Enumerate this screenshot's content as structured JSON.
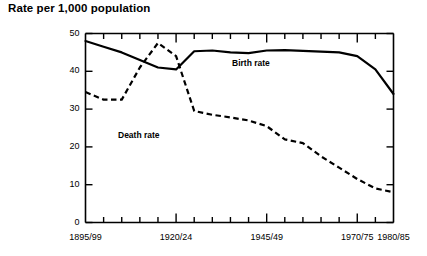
{
  "chart_data": {
    "type": "line",
    "title": "Rate per 1,000 population",
    "xlabel": "",
    "ylabel": "",
    "ylim": [
      0,
      50
    ],
    "yticks": [
      0,
      10,
      20,
      30,
      40,
      50
    ],
    "ytick_labels": [
      "0",
      "10",
      "20",
      "30",
      "40",
      "50"
    ],
    "grid": false,
    "legend": "inline-annotations",
    "x_categories": [
      "1895/99",
      "1900/04",
      "1905/09",
      "1910/14",
      "1915/19",
      "1920/24",
      "1925/29",
      "1930/34",
      "1935/39",
      "1940/44",
      "1945/49",
      "1950/54",
      "1955/59",
      "1960/64",
      "1965/69",
      "1970/75",
      "1975/79",
      "1980/85"
    ],
    "xtick_labels": [
      "1895/99",
      "1920/24",
      "1945/49",
      "1970/75",
      "1980/85"
    ],
    "xtick_label_positions": [
      0,
      5,
      10,
      15,
      17
    ],
    "series": [
      {
        "name": "Birth rate",
        "style": "solid",
        "annotation": "Birth rate",
        "values": [
          48.0,
          46.5,
          45.0,
          43.0,
          41.0,
          40.5,
          45.3,
          45.5,
          45.0,
          44.8,
          45.5,
          45.6,
          45.4,
          45.2,
          45.0,
          44.0,
          40.5,
          34.0
        ]
      },
      {
        "name": "Death rate",
        "style": "dashed",
        "annotation": "Death rate",
        "values": [
          34.5,
          32.5,
          32.5,
          41.0,
          47.5,
          44.0,
          29.5,
          28.5,
          27.8,
          27.0,
          25.5,
          22.0,
          21.0,
          17.5,
          14.5,
          11.5,
          9.0,
          8.0
        ]
      }
    ]
  }
}
